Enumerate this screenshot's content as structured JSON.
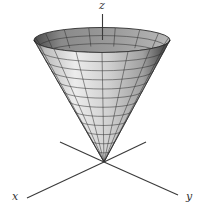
{
  "figure": {
    "type": "3d-surface-diagram",
    "surface": "cone",
    "axes": {
      "x_label": "x",
      "y_label": "y",
      "z_label": "z"
    },
    "mesh": {
      "radial_lines": 16,
      "height_rings": 12
    },
    "colors": {
      "background": "#ffffff",
      "surface_light": "#e6e6e6",
      "surface_mid": "#a8a8a8",
      "surface_dark": "#4a4a4a",
      "inner_surface": "#7a7a7a",
      "grid": "#2b2b2b",
      "axes": "#3a3a3a"
    }
  }
}
